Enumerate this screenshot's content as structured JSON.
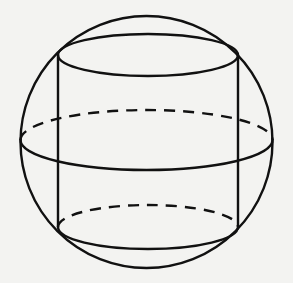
{
  "diagram": {
    "title": "Cylinder inscribed in a sphere",
    "colors": {
      "line": "#111111",
      "background": "#f3f3f1"
    },
    "sphere": {
      "cx": 146.5,
      "cy": 142,
      "r": 126
    },
    "equator": {
      "cx": 146.5,
      "cy": 140,
      "rx": 126,
      "ry": 30,
      "back": "dashed",
      "front": "solid"
    },
    "cylinder": {
      "left_x": 58,
      "right_x": 238,
      "top_ellipse": {
        "cx": 148,
        "cy": 55,
        "rx": 90,
        "ry": 21,
        "style": "solid"
      },
      "bottom_ellipse": {
        "cx": 148,
        "cy": 227,
        "rx": 90,
        "ry": 22,
        "back": "dashed",
        "front": "solid"
      }
    }
  }
}
